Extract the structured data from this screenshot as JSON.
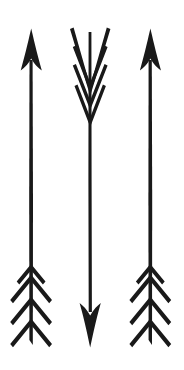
{
  "canvas": {
    "width": 184,
    "height": 370,
    "background_color": "#ffffff",
    "ink_color": "#191919",
    "title": "Three hand-drawn arrows"
  },
  "arrows": [
    {
      "id": "left-arrow",
      "label": "Left arrow",
      "direction": "up",
      "shaft_x": 31,
      "shaft_top": 52,
      "shaft_bottom": 346,
      "shaft_width": 3.4,
      "head": {
        "position": "top",
        "tip_y": 29,
        "base_y": 72,
        "half_width": 11
      },
      "fletching": {
        "position": "bottom",
        "chevron_count": 4,
        "start_y": 276,
        "spacing": 22,
        "half_width": 21,
        "drop": 26
      }
    },
    {
      "id": "middle-arrow",
      "label": "Middle arrow",
      "direction": "down",
      "shaft_x": 90,
      "shaft_top": 30,
      "shaft_bottom": 316,
      "shaft_width": 3.2,
      "head": {
        "position": "bottom",
        "tip_y": 347,
        "base_y": 307,
        "half_width": 11
      },
      "fletching": {
        "position": "top",
        "chevron_count": 4,
        "start_y": 92,
        "spacing": 21,
        "half_width": 20,
        "drop": 25
      }
    },
    {
      "id": "right-arrow",
      "label": "Right arrow",
      "direction": "up",
      "shaft_x": 150,
      "shaft_top": 52,
      "shaft_bottom": 346,
      "shaft_width": 3.4,
      "head": {
        "position": "top",
        "tip_y": 29,
        "base_y": 72,
        "half_width": 11
      },
      "fletching": {
        "position": "bottom",
        "chevron_count": 4,
        "start_y": 276,
        "spacing": 22,
        "half_width": 21,
        "drop": 26
      }
    }
  ]
}
